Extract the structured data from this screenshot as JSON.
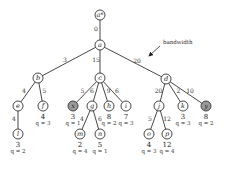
{
  "diagram": {
    "annotation": {
      "label": "bandwidth",
      "x": 163,
      "y": 44,
      "arrow_from": [
        160,
        46
      ],
      "arrow_to": [
        149,
        56
      ]
    },
    "nodes": [
      {
        "id": "a*",
        "label": "a*",
        "x": 100,
        "y": 15,
        "shaded": false
      },
      {
        "id": "a",
        "label": "a",
        "x": 100,
        "y": 45,
        "shaded": false
      },
      {
        "id": "b",
        "label": "b",
        "x": 38,
        "y": 78,
        "shaded": false
      },
      {
        "id": "c",
        "label": "c",
        "x": 100,
        "y": 78,
        "shaded": false
      },
      {
        "id": "d",
        "label": "d",
        "x": 166,
        "y": 79,
        "shaded": false
      },
      {
        "id": "e",
        "label": "e",
        "x": 18,
        "y": 106,
        "shaded": false
      },
      {
        "id": "f",
        "label": "f",
        "x": 43,
        "y": 106,
        "shaded": false,
        "value": "4",
        "q": "q = 3"
      },
      {
        "id": "x",
        "label": "x",
        "x": 73,
        "y": 106,
        "shaded": true,
        "value": "3",
        "q": "q = 1"
      },
      {
        "id": "g",
        "label": "g",
        "x": 92,
        "y": 106,
        "shaded": false
      },
      {
        "id": "h",
        "label": "h",
        "x": 109,
        "y": 106,
        "shaded": false,
        "value": "8",
        "q": "q = 2"
      },
      {
        "id": "i",
        "label": "i",
        "x": 126,
        "y": 106,
        "shaded": false,
        "value": "7",
        "q": "q = 3"
      },
      {
        "id": "j",
        "label": "j",
        "x": 159,
        "y": 106,
        "shaded": false
      },
      {
        "id": "k",
        "label": "k",
        "x": 183,
        "y": 106,
        "shaded": false,
        "value": "3",
        "q": "q = 3"
      },
      {
        "id": "y",
        "label": "y",
        "x": 206,
        "y": 106,
        "shaded": true,
        "value": "8",
        "q": "q = 2"
      },
      {
        "id": "l",
        "label": "l",
        "x": 18,
        "y": 134,
        "shaded": false,
        "value": "3",
        "q": "q = 2"
      },
      {
        "id": "m",
        "label": "m",
        "x": 80,
        "y": 134,
        "shaded": false,
        "value": "2",
        "q": "q = 4"
      },
      {
        "id": "n",
        "label": "n",
        "x": 100,
        "y": 134,
        "shaded": false,
        "value": "5",
        "q": "q = 1"
      },
      {
        "id": "o",
        "label": "o",
        "x": 149,
        "y": 134,
        "shaded": false,
        "value": "4",
        "q": "q = 3"
      },
      {
        "id": "p",
        "label": "p",
        "x": 167,
        "y": 134,
        "shaded": false,
        "value": "12",
        "q": "q = 4"
      }
    ],
    "edges": [
      {
        "from": "a*",
        "to": "a",
        "label": "0"
      },
      {
        "from": "a",
        "to": "b",
        "label": "3"
      },
      {
        "from": "a",
        "to": "c",
        "label": "15"
      },
      {
        "from": "a",
        "to": "d",
        "label": "20"
      },
      {
        "from": "b",
        "to": "e",
        "label": "4"
      },
      {
        "from": "b",
        "to": "f",
        "label": "5"
      },
      {
        "from": "c",
        "to": "x",
        "label": "5"
      },
      {
        "from": "c",
        "to": "g",
        "label": "6"
      },
      {
        "from": "c",
        "to": "h",
        "label": "9"
      },
      {
        "from": "c",
        "to": "i",
        "label": "6"
      },
      {
        "from": "d",
        "to": "j",
        "label": "20"
      },
      {
        "from": "d",
        "to": "k",
        "label": "2"
      },
      {
        "from": "d",
        "to": "y",
        "label": "10"
      },
      {
        "from": "e",
        "to": "l",
        "label": "4"
      },
      {
        "from": "g",
        "to": "m",
        "label": "4"
      },
      {
        "from": "g",
        "to": "n",
        "label": "6"
      },
      {
        "from": "j",
        "to": "o",
        "label": "5"
      },
      {
        "from": "j",
        "to": "p",
        "label": "12"
      }
    ]
  }
}
